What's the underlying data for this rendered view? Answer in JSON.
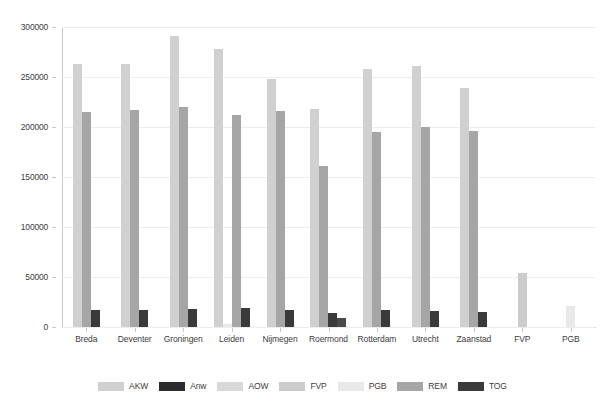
{
  "chart_data": {
    "type": "bar",
    "title": "",
    "subtitle": "",
    "xlabel": "",
    "ylabel": "",
    "ylim": [
      0,
      300000
    ],
    "ytick_labels": [
      "0",
      "50000",
      "100000",
      "150000",
      "200000",
      "250000",
      "300000"
    ],
    "ytick_values": [
      0,
      50000,
      100000,
      150000,
      200000,
      250000,
      300000
    ],
    "grid": true,
    "legend_position": "bottom",
    "categories": [
      "Breda",
      "Deventer",
      "Groningen",
      "Leiden",
      "Nijmegen",
      "Roermond",
      "Rotterdam",
      "Utrecht",
      "Zaanstad",
      "FVP",
      "PGB"
    ],
    "series": [
      {
        "name": "AKW",
        "color": "#d0d0d0",
        "values": [
          263000,
          263000,
          291000,
          278000,
          248000,
          218000,
          258000,
          261000,
          239000,
          null,
          null
        ]
      },
      {
        "name": "Anw",
        "color": "#2b2b2b",
        "values": [
          null,
          null,
          null,
          null,
          null,
          null,
          null,
          null,
          null,
          null,
          null
        ]
      },
      {
        "name": "AOW",
        "color": "#d9d9d9",
        "values": [
          null,
          null,
          null,
          null,
          null,
          null,
          null,
          null,
          null,
          null,
          null
        ]
      },
      {
        "name": "FVP",
        "color": "#cccccc",
        "values": [
          null,
          null,
          null,
          null,
          null,
          null,
          null,
          null,
          null,
          54000,
          null
        ]
      },
      {
        "name": "PGB",
        "color": "#e8e8e8",
        "values": [
          null,
          null,
          null,
          3000,
          null,
          null,
          null,
          null,
          null,
          null,
          21000
        ]
      },
      {
        "name": "REM",
        "color": "#a6a6a6",
        "values": [
          215000,
          217000,
          220000,
          212000,
          216000,
          161000,
          195000,
          200000,
          196000,
          null,
          null
        ]
      },
      {
        "name": "TOG",
        "color": "#3a3a3a",
        "values": [
          17500,
          16800,
          17800,
          19000,
          16800,
          14000,
          17000,
          16000,
          14800,
          null,
          null
        ]
      }
    ],
    "extra_bars": [
      {
        "category": "Roermond",
        "series": "TOG-secondary",
        "color": "#4a4a4a",
        "value": 9500
      }
    ]
  },
  "legend": {
    "items": [
      {
        "label": "AKW",
        "color": "#d0d0d0"
      },
      {
        "label": "Anw",
        "color": "#2b2b2b"
      },
      {
        "label": "AOW",
        "color": "#d9d9d9"
      },
      {
        "label": "FVP",
        "color": "#cccccc"
      },
      {
        "label": "PGB",
        "color": "#e8e8e8"
      },
      {
        "label": "REM",
        "color": "#a6a6a6"
      },
      {
        "label": "TOG",
        "color": "#3a3a3a"
      }
    ]
  },
  "axis_colors": {
    "axis_line": "#c9c9c9",
    "gridline": "#ededed",
    "tick_text": "#3c3c3c"
  }
}
